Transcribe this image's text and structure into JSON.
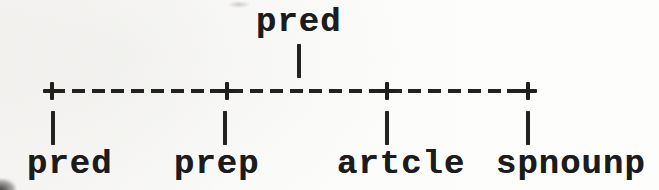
{
  "diagram": {
    "type": "parse-tree",
    "ink_color": "#1c1c1c",
    "paper_color": "#fbfbfa",
    "root": {
      "label": "pred"
    },
    "root_connector_glyph": "|",
    "branch_line_ascii": "+--------+--------+-------+",
    "child_connector_glyph": "|",
    "children": [
      {
        "label": "pred"
      },
      {
        "label": "prep"
      },
      {
        "label": "artcle"
      },
      {
        "label": "spnounp"
      }
    ]
  }
}
